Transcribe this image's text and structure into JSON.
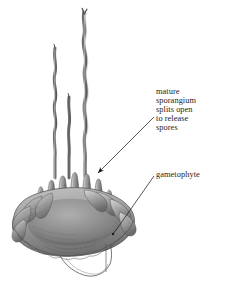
{
  "figure": {
    "kind": "botanical-line-illustration",
    "background_color": "#ffffff",
    "ink_color": "#1d1d1d",
    "mid_tone": "#8d8d8d",
    "light_tone": "#c9c9c9",
    "shadow_tone": "#5a5a5a"
  },
  "annotations": [
    {
      "id": "mature-sporangium",
      "lines": [
        "mature",
        "sporangium",
        "splits open",
        "to release",
        "spores"
      ],
      "leader": {
        "from_x": 154,
        "from_y": 117,
        "to_x": 96,
        "to_y": 174,
        "marker": "arrowhead"
      }
    },
    {
      "id": "gametophyte",
      "lines": [
        "gametophyte"
      ],
      "leader": {
        "from_x": 154,
        "from_y": 176,
        "to_x": 113,
        "to_y": 234,
        "marker": "dot"
      }
    }
  ],
  "structures": {
    "stalks": [
      {
        "name": "seta-left",
        "label": "wavy stalk, left"
      },
      {
        "name": "seta-center",
        "label": "short stalk, center"
      },
      {
        "name": "seta-right-tall",
        "label": "tallest wavy stalk with forked tip"
      }
    ],
    "base": {
      "name": "gametophyte-thallus",
      "label": "lobed rosette thallus with radiating scalloped lobes"
    },
    "sporangia": {
      "name": "sporangium-cluster",
      "label": "upright finger-like sporangia emerging from thallus center",
      "count": 9
    }
  }
}
